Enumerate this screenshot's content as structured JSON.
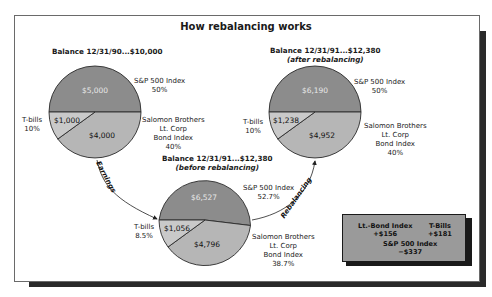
{
  "title": "How rebalancing works",
  "colors": {
    "sp500": "#8c8c8c",
    "bond": "#b6b6b6",
    "tbills": "#c9c9c9",
    "outline": "#2a2a2a",
    "delta_box": "#9a9a9a"
  },
  "pies": {
    "start": {
      "balance_label": "Balance 12/31/90...$10,000",
      "slices": {
        "sp500": {
          "value": "$5,000",
          "name": "S&P 500 Index",
          "pct": "50%"
        },
        "bond": {
          "value": "$4,000",
          "name_lines": [
            "Salomon Brothers",
            "Lt. Corp",
            "Bond Index"
          ],
          "pct": "40%"
        },
        "tbills": {
          "value": "$1,000",
          "name": "T-bills",
          "pct": "10%"
        }
      }
    },
    "before": {
      "balance_label": "Balance 12/31/91...$12,380",
      "sub_label": "(before rebalancing)",
      "slices": {
        "sp500": {
          "value": "$6,527",
          "name": "S&P 500 Index",
          "pct": "52.7%"
        },
        "bond": {
          "value": "$4,796",
          "name_lines": [
            "Salomon Brothers",
            "Lt. Corp",
            "Bond Index"
          ],
          "pct": "38.7%"
        },
        "tbills": {
          "value": "$1,056",
          "name": "T-bills",
          "pct": "8.5%"
        }
      }
    },
    "after": {
      "balance_label": "Balance 12/31/91...$12,380",
      "sub_label": "(after rebalancing)",
      "slices": {
        "sp500": {
          "value": "$6,190",
          "name": "S&P 500 Index",
          "pct": "50%"
        },
        "bond": {
          "value": "$4,952",
          "name_lines": [
            "Salomon Brothers",
            "Lt. Corp",
            "Bond Index"
          ],
          "pct": "40%"
        },
        "tbills": {
          "value": "$1,238",
          "name": "T-bills",
          "pct": "10%"
        }
      }
    }
  },
  "arrows": {
    "earnings": "Earnings",
    "rebalancing": "Rebalancing"
  },
  "changes": {
    "bond": {
      "name": "Lt.-Bond Index",
      "value": "+$156"
    },
    "tbills": {
      "name": "T-Bills",
      "value": "+$181"
    },
    "sp500": {
      "name": "S&P 500 Index",
      "value": "−$337"
    }
  }
}
